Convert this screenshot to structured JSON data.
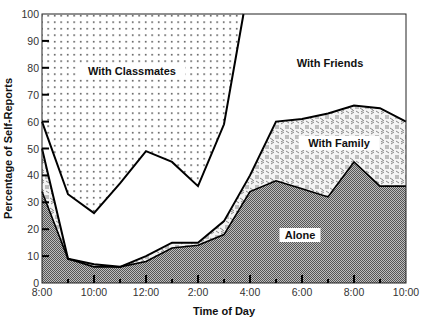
{
  "chart_data": {
    "type": "area",
    "title": "",
    "xlabel": "Time of Day",
    "ylabel": "Percentage of Self-Reports",
    "ylim": [
      0,
      100
    ],
    "yticks": [
      "0",
      "10",
      "20",
      "30",
      "40",
      "50",
      "60",
      "70",
      "80",
      "90",
      "100"
    ],
    "xtick_labels": [
      "8:00",
      "10:00",
      "12:00",
      "2:00",
      "4:00",
      "6:00",
      "8:00",
      "10:00"
    ],
    "x": [
      "8:00",
      "9:00",
      "10:00",
      "11:00",
      "12:00",
      "1:00",
      "2:00",
      "3:00",
      "4:00",
      "5:00",
      "6:00",
      "7:00",
      "8:00",
      "9:00",
      "10:00"
    ],
    "stacked": true,
    "grid": false,
    "series": [
      {
        "name": "Alone",
        "cumulative_top": [
          34,
          9,
          6,
          6,
          8,
          13,
          14,
          18,
          34,
          38,
          35,
          32,
          45,
          36,
          36
        ]
      },
      {
        "name": "With Family",
        "cumulative_top": [
          50,
          9,
          7,
          6,
          10,
          15,
          15,
          23,
          40,
          60,
          61,
          63,
          66,
          65,
          60
        ]
      },
      {
        "name": "With Friends",
        "cumulative_top": [
          60,
          33,
          26,
          37,
          49,
          45,
          36,
          59,
          100,
          100,
          100,
          100,
          100,
          100,
          100
        ]
      },
      {
        "name": "With Classmates",
        "cumulative_top": [
          100,
          100,
          100,
          100,
          100,
          100,
          100,
          100,
          100,
          100,
          100,
          100,
          100,
          100,
          100
        ]
      }
    ],
    "annotations": [
      "With Classmates",
      "With Friends",
      "With Family",
      "Alone"
    ]
  }
}
